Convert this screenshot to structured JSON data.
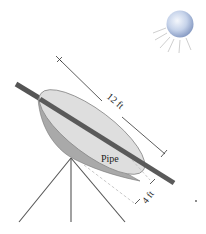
{
  "diagram": {
    "type": "parabolic solar collector",
    "labels": {
      "length": "12 ft",
      "depth": "4 ft",
      "pipe": "Pipe"
    },
    "colors": {
      "background": "#ffffff",
      "dish_face": "#dcdcdc",
      "dish_rim": "#8a8a8a",
      "dish_underside": "#a8a8a8",
      "pipe": "#555555",
      "stand": "#555555",
      "dimension_line": "#333333",
      "sun_center": "#e8eef8",
      "sun_edge": "#8ea2c8",
      "sun_rays": "#c8c8c8"
    },
    "icons": [
      "sun-icon"
    ]
  }
}
